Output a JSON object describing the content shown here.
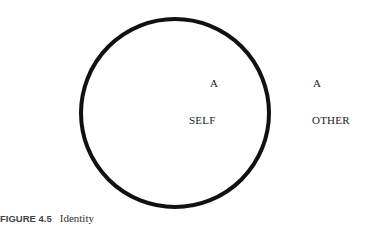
{
  "diagram": {
    "self_symbol": "A",
    "self_label": "SELF",
    "other_symbol": "A",
    "other_label": "OTHER"
  },
  "caption": {
    "number": "FIGURE 4.5",
    "title": "Identity"
  }
}
